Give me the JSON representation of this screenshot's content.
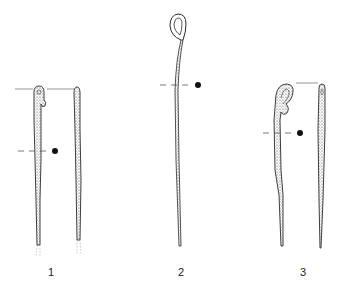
{
  "figure": {
    "type": "archaeological drawing plate",
    "colors": {
      "ink": "#2a2a2a",
      "background": "#ffffff",
      "guide": "#555555"
    },
    "items": [
      {
        "number": "1",
        "views": [
          "front",
          "side"
        ],
        "head": "broken loop",
        "section": "round"
      },
      {
        "number": "2",
        "views": [
          "front"
        ],
        "head": "coiled loop",
        "section": "round"
      },
      {
        "number": "3",
        "views": [
          "front",
          "side"
        ],
        "head": "hooked loop",
        "section": "round"
      }
    ]
  }
}
